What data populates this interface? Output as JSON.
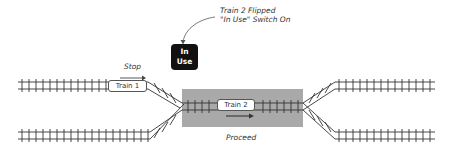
{
  "diagram": {
    "annotation": {
      "line1": "Train 2 Flipped",
      "line2": "\"In Use\" Switch On"
    },
    "switch": {
      "line1": "In",
      "line2": "Use",
      "color": "#111111"
    },
    "trains": [
      {
        "label": "Train 1",
        "action": "Stop"
      },
      {
        "label": "Train 2",
        "action": "Proceed"
      }
    ],
    "block_color": "#a9a9a9",
    "track_color": "#333333"
  }
}
